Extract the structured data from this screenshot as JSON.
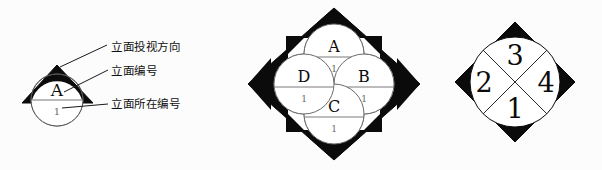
{
  "figure": {
    "background_color": "#fcfcfc",
    "ink_color": "#000000",
    "thin_line_color": "#5a5a5a"
  },
  "legend": {
    "items": [
      {
        "key": "direction",
        "text": "立面投视方向"
      },
      {
        "key": "number",
        "text": "立面编号"
      },
      {
        "key": "location",
        "text": "立面所在编号"
      }
    ]
  },
  "single_symbol": {
    "name": "single-elevation-index",
    "elevation_letter": "A",
    "sheet_number": "1",
    "arrow_direction": "up"
  },
  "four_way_symbol": {
    "name": "four-way-elevation-index",
    "circles": [
      {
        "position": "top",
        "letter": "A",
        "sheet_number": "1"
      },
      {
        "position": "right",
        "letter": "B",
        "sheet_number": "1"
      },
      {
        "position": "bottom",
        "letter": "C",
        "sheet_number": "1"
      },
      {
        "position": "left",
        "letter": "D",
        "sheet_number": "1"
      }
    ]
  },
  "quadrant_symbol": {
    "name": "quadrant-elevation-index",
    "quadrants": [
      {
        "position": "top",
        "number": "3"
      },
      {
        "position": "right",
        "number": "4"
      },
      {
        "position": "bottom",
        "number": "1"
      },
      {
        "position": "left",
        "number": "2"
      }
    ]
  }
}
